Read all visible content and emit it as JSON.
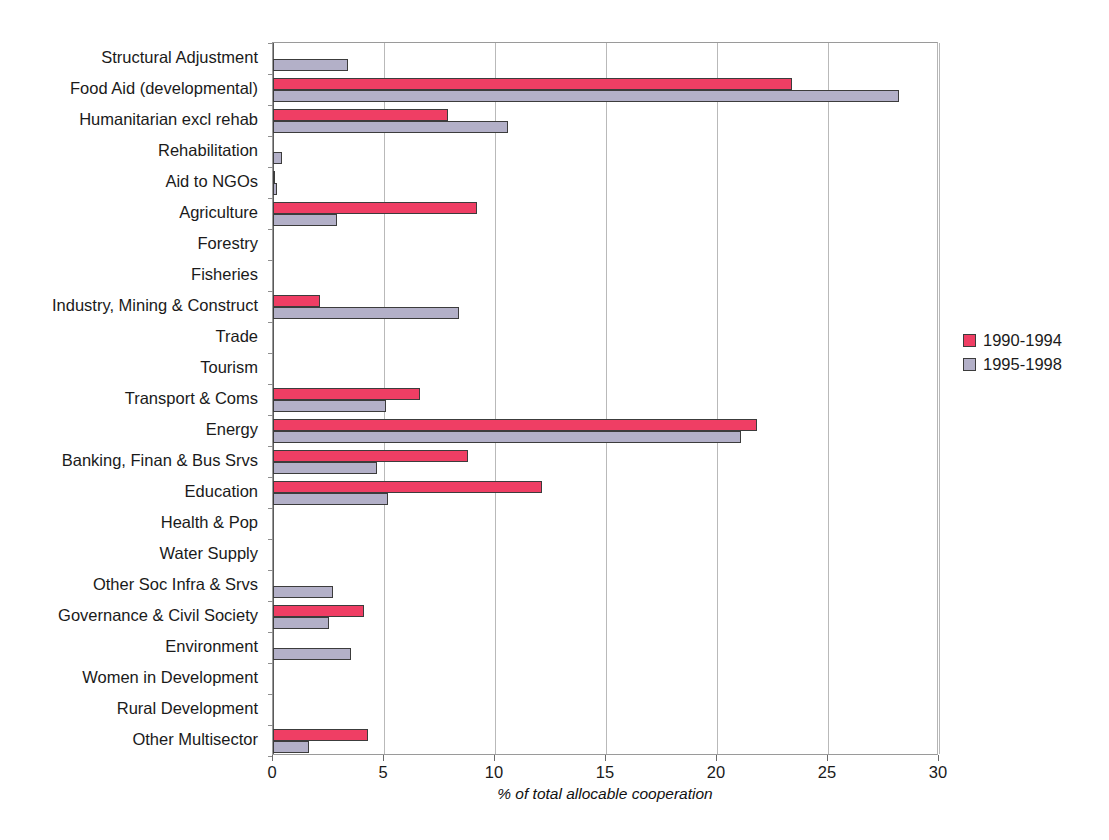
{
  "chart_data": {
    "type": "bar",
    "orientation": "horizontal",
    "title": "",
    "xlabel": "% of total allocable cooperation",
    "ylabel": "",
    "xlim": [
      0,
      30
    ],
    "xticks": [
      0,
      5,
      10,
      15,
      20,
      25,
      30
    ],
    "grid": true,
    "legend_position": "right",
    "categories": [
      "Structural Adjustment",
      "Food Aid (developmental)",
      "Humanitarian excl rehab",
      "Rehabilitation",
      "Aid to NGOs",
      "Agriculture",
      "Forestry",
      "Fisheries",
      "Industry, Mining & Construct",
      "Trade",
      "Tourism",
      "Transport & Coms",
      "Energy",
      "Banking, Finan & Bus Srvs",
      "Education",
      "Health & Pop",
      "Water Supply",
      "Other Soc Infra & Srvs",
      "Governance & Civil Society",
      "Environment",
      "Women in Development",
      "Rural Development",
      "Other Multisector"
    ],
    "series": [
      {
        "name": "1990-1994",
        "color": "#ef3e64",
        "values": [
          0,
          23.4,
          7.9,
          0,
          0.1,
          9.2,
          0,
          0,
          2.1,
          0,
          0,
          6.6,
          21.8,
          8.8,
          12.1,
          0,
          0,
          0,
          4.1,
          0,
          0,
          0,
          4.3
        ]
      },
      {
        "name": "1995-1998",
        "color": "#b3b0c8",
        "values": [
          3.4,
          28.2,
          10.6,
          0.4,
          0.2,
          2.9,
          0,
          0,
          8.4,
          0,
          0,
          5.1,
          21.1,
          4.7,
          5.2,
          0,
          0,
          2.7,
          2.5,
          3.5,
          0,
          0,
          1.6
        ]
      }
    ]
  }
}
